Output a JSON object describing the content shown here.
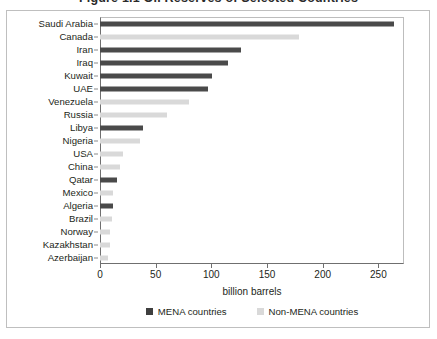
{
  "figure": {
    "title_clipped": "Figure 1.1  Oil Reserves of Selected Countries",
    "axis_title": "billion barrels"
  },
  "legend": {
    "items": [
      {
        "label": "MENA countries",
        "color": "#3f3f3f",
        "key": "mena"
      },
      {
        "label": "Non-MENA countries",
        "color": "#d9d9d9",
        "key": "non"
      }
    ]
  },
  "chart_data": {
    "type": "bar",
    "orientation": "horizontal",
    "title": "Figure 1.1  Oil Reserves of Selected Countries",
    "xlabel": "billion barrels",
    "ylabel": "",
    "xlim": [
      0,
      273
    ],
    "xticks": [
      0,
      50,
      100,
      150,
      200,
      250
    ],
    "grid": false,
    "legend_position": "bottom",
    "categories": [
      "Saudi Arabia",
      "Canada",
      "Iran",
      "Iraq",
      "Kuwait",
      "UAE",
      "Venezuela",
      "Russia",
      "Libya",
      "Nigeria",
      "USA",
      "China",
      "Qatar",
      "Mexico",
      "Algeria",
      "Brazil",
      "Norway",
      "Kazakhstan",
      "Azerbaijan"
    ],
    "values": [
      264,
      179,
      127,
      115,
      101,
      97,
      80,
      60,
      39,
      36,
      21,
      18,
      15,
      12,
      12,
      11,
      9,
      9,
      7
    ],
    "groups": [
      "mena",
      "non",
      "mena",
      "mena",
      "mena",
      "mena",
      "non",
      "non",
      "mena",
      "non",
      "non",
      "non",
      "mena",
      "non",
      "mena",
      "non",
      "non",
      "non",
      "non"
    ]
  }
}
